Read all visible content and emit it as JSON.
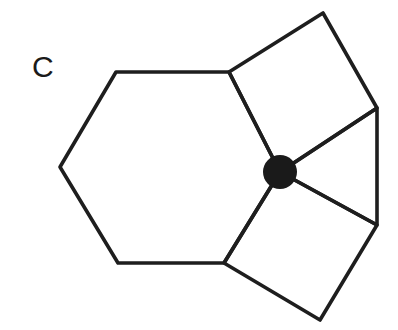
{
  "figure": {
    "panel_label": "C",
    "colors": {
      "stroke": "#1e1e1e",
      "vertex_dot": "#1a1a1a",
      "background": "#ffffff"
    },
    "shapes": [
      {
        "name": "hexagon",
        "points": [
          [
            60,
            167
          ],
          [
            116,
            72
          ],
          [
            229,
            72
          ],
          [
            280,
            172
          ],
          [
            224,
            263
          ],
          [
            118,
            263
          ]
        ]
      },
      {
        "name": "square-top",
        "points": [
          [
            229,
            72
          ],
          [
            323,
            13
          ],
          [
            377,
            108
          ],
          [
            280,
            172
          ]
        ]
      },
      {
        "name": "triangle",
        "points": [
          [
            280,
            172
          ],
          [
            377,
            108
          ],
          [
            377,
            225
          ]
        ]
      },
      {
        "name": "square-bottom",
        "points": [
          [
            280,
            172
          ],
          [
            377,
            225
          ],
          [
            320,
            320
          ],
          [
            224,
            263
          ]
        ]
      }
    ],
    "vertex": {
      "cx": 280,
      "cy": 172,
      "r": 17
    }
  }
}
